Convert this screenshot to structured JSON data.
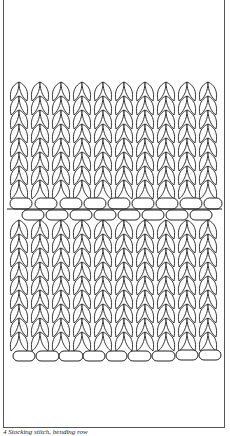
{
  "figure": {
    "caption": "4 Stocking stitch, bending row",
    "illustration": "knitting-stitch-diagram",
    "stitch_columns": 10,
    "line_color": "#222222",
    "frame_color": "#555555"
  }
}
